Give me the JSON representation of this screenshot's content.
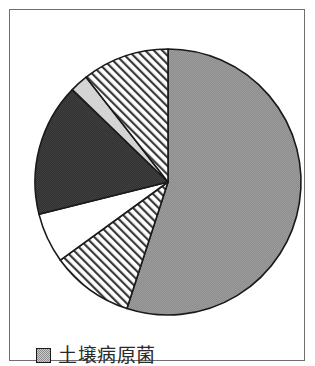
{
  "figure": {
    "background_color": "#ffffff",
    "frame_color": "#6f6f6f"
  },
  "legend": {
    "position": "bottom-left",
    "entries": [
      {
        "label": "土壌病原菌",
        "swatch_name": "legend-swatch-gray",
        "color": "#8d8d8d",
        "pattern": "solid-gray-dither"
      }
    ]
  },
  "chart_data": {
    "type": "pie",
    "title": "",
    "subtitle": "",
    "xlabel": "",
    "ylabel": "",
    "grid": false,
    "legend_position": "bottom-left",
    "start_angle_deg": 90,
    "direction": "clockwise",
    "center": {
      "x": 148,
      "y": 162
    },
    "radius": 133,
    "categories": [
      "土壌病原菌",
      "スライス2",
      "スライス3",
      "スライス4",
      "スライス5",
      "スライス6"
    ],
    "labels_visible": [
      "土壌病原菌"
    ],
    "values": [
      55,
      10,
      6,
      16,
      2,
      11
    ],
    "slices": [
      {
        "name": "土壌病原菌",
        "value": 55,
        "start_deg": 0,
        "end_deg": 198,
        "fill": "#8d8d8d",
        "pattern": "solid-gray-dither",
        "stroke": "#1a1a1a"
      },
      {
        "name": "スライス2",
        "value": 10,
        "start_deg": 198,
        "end_deg": 234,
        "fill": "#ffffff",
        "pattern": "diagonal-hatch",
        "stroke": "#1a1a1a"
      },
      {
        "name": "スライス3",
        "value": 6,
        "start_deg": 234,
        "end_deg": 256,
        "fill": "#ffffff",
        "pattern": "solid-white",
        "stroke": "#1a1a1a"
      },
      {
        "name": "スライス4",
        "value": 16,
        "start_deg": 256,
        "end_deg": 314,
        "fill": "#333333",
        "pattern": "solid-dark-dither",
        "stroke": "#1a1a1a"
      },
      {
        "name": "スライス5",
        "value": 2,
        "start_deg": 314,
        "end_deg": 322,
        "fill": "#d4d4d4",
        "pattern": "solid-light",
        "stroke": "#1a1a1a"
      },
      {
        "name": "スライス6",
        "value": 11,
        "start_deg": 322,
        "end_deg": 360,
        "fill": "#ffffff",
        "pattern": "diagonal-hatch",
        "stroke": "#1a1a1a"
      }
    ]
  }
}
